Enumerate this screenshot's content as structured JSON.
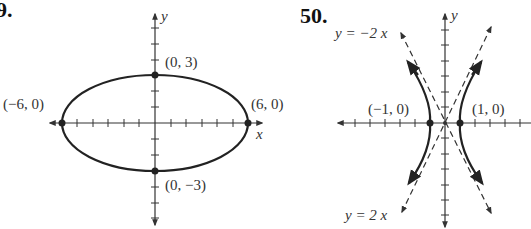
{
  "figures": [
    {
      "number": "9.",
      "type": "ellipse",
      "axis_labels": {
        "x": "x",
        "y": "y"
      },
      "points": [
        {
          "label": "(0, 3)",
          "x": 0,
          "y": 3
        },
        {
          "label": "(0, −3)",
          "x": 0,
          "y": -3
        },
        {
          "label": "(−6, 0)",
          "x": -6,
          "y": 0
        },
        {
          "label": "(6, 0)",
          "x": 6,
          "y": 0
        }
      ]
    },
    {
      "number": "50.",
      "type": "hyperbola",
      "axis_labels": {
        "x": "x",
        "y": "y"
      },
      "points": [
        {
          "label": "(−1, 0)",
          "x": -1,
          "y": 0
        },
        {
          "label": "(1, 0)",
          "x": 1,
          "y": 0
        }
      ],
      "asymptotes": [
        {
          "label": "y = −2 x"
        },
        {
          "label": "y = 2 x"
        }
      ]
    }
  ],
  "colors": {
    "curve": "#222222",
    "axis": "#333333",
    "text": "#333333"
  }
}
